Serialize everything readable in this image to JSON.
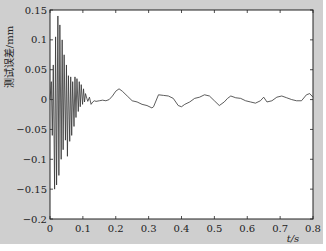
{
  "chart_data": {
    "type": "line",
    "title": "",
    "xlabel": "t/s",
    "ylabel": "测试误差/mm",
    "xlim": [
      0,
      0.8
    ],
    "ylim": [
      -0.2,
      0.15
    ],
    "xticks": [
      0,
      0.1,
      0.2,
      0.3,
      0.4,
      0.5,
      0.6,
      0.7,
      0.8
    ],
    "xtick_labels": [
      "0",
      "0.1",
      "0.2",
      "0.3",
      "0.4",
      "0.5",
      "0.6",
      "0.7",
      "0.8"
    ],
    "yticks": [
      -0.2,
      -0.15,
      -0.1,
      -0.05,
      0,
      0.05,
      0.1,
      0.15
    ],
    "ytick_labels": [
      "−0.2",
      "−0.15",
      "−0.1",
      "−0.05",
      "0",
      "0.05",
      "0.1",
      "0.15"
    ],
    "grid": false,
    "series": [
      {
        "name": "测试误差",
        "color": "#333333",
        "x": [
          0.0,
          0.004,
          0.007,
          0.01,
          0.014,
          0.017,
          0.02,
          0.024,
          0.027,
          0.03,
          0.034,
          0.037,
          0.04,
          0.043,
          0.047,
          0.05,
          0.053,
          0.056,
          0.06,
          0.063,
          0.066,
          0.069,
          0.073,
          0.076,
          0.079,
          0.082,
          0.086,
          0.089,
          0.092,
          0.095,
          0.099,
          0.102,
          0.105,
          0.108,
          0.112,
          0.115,
          0.12,
          0.125,
          0.13,
          0.135,
          0.14,
          0.15,
          0.16,
          0.17,
          0.18,
          0.19,
          0.2,
          0.21,
          0.22,
          0.235,
          0.25,
          0.265,
          0.28,
          0.295,
          0.31,
          0.315,
          0.33,
          0.345,
          0.36,
          0.375,
          0.39,
          0.4,
          0.41,
          0.425,
          0.44,
          0.455,
          0.47,
          0.485,
          0.5,
          0.515,
          0.53,
          0.54,
          0.55,
          0.565,
          0.58,
          0.595,
          0.61,
          0.625,
          0.64,
          0.65,
          0.66,
          0.675,
          0.69,
          0.705,
          0.72,
          0.735,
          0.75,
          0.765,
          0.78,
          0.79,
          0.8
        ],
        "y": [
          0.0,
          0.03,
          -0.06,
          0.058,
          -0.15,
          0.105,
          -0.143,
          0.14,
          -0.127,
          0.125,
          -0.1,
          0.1,
          -0.084,
          0.075,
          -0.068,
          0.058,
          -0.095,
          0.04,
          -0.07,
          0.038,
          -0.06,
          0.03,
          -0.045,
          0.038,
          -0.03,
          0.035,
          -0.02,
          0.03,
          -0.012,
          0.025,
          -0.008,
          0.018,
          -0.004,
          0.01,
          0.002,
          -0.003,
          0.004,
          -0.008,
          -0.004,
          -0.002,
          -0.003,
          -0.002,
          -0.001,
          -0.002,
          0.0,
          0.006,
          0.014,
          0.018,
          0.014,
          0.006,
          -0.002,
          -0.004,
          -0.008,
          -0.01,
          -0.014,
          -0.012,
          0.008,
          0.007,
          0.006,
          0.002,
          -0.01,
          -0.012,
          -0.008,
          -0.004,
          0.002,
          0.004,
          0.008,
          0.006,
          -0.002,
          -0.01,
          -0.004,
          0.002,
          0.006,
          0.003,
          0.002,
          -0.002,
          -0.004,
          -0.006,
          -0.002,
          0.004,
          -0.004,
          -0.002,
          0.004,
          0.006,
          0.003,
          0.0,
          -0.002,
          -0.002,
          0.008,
          0.01,
          0.004
        ]
      }
    ]
  }
}
